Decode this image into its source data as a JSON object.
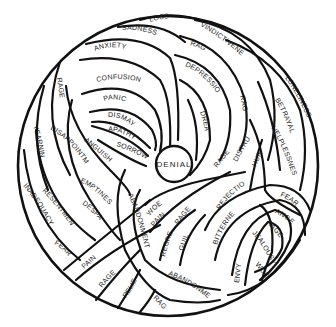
{
  "diagram": {
    "type": "tangled-emotion-ball",
    "center": "DENIAL",
    "colors": {
      "stroke": "#111111",
      "fill": "#ffffff",
      "text": "#1a1a1a"
    },
    "labels": {
      "loss": "LOSS",
      "sadness": "SADNESS",
      "anxiety": "ANXIETY",
      "confusion": "CONFUSION",
      "panic": "PANIC",
      "dismay": "DISMAY",
      "apathy": "APATHY",
      "sorrow": "SORROW",
      "rage_left": "RAGE",
      "yearning": "YEARNING",
      "disappointment": "DISAPPOINTMENT",
      "anguish": "ANGUISH",
      "emptiness": "EMPTINESS",
      "despair": "DESPAIR",
      "resentment": "RESENTMENT",
      "inadequacy": "INADEQUACY",
      "fear_left": "FEAR",
      "pain_bottom": "PAIN",
      "rage_bottom": "RAGE",
      "relief": "RELIEF",
      "rage_bottom2": "RAGE",
      "abandonment_bottom": "ABANDONMENT",
      "abandonment_mid": "ABANDONMENT",
      "woe_center": "WOE",
      "pain_center": "PAIN",
      "rage_center": "RAGE",
      "regret": "REGRET",
      "guilt": "GUILT",
      "vindictiveness": "VINDICTIVENESS",
      "rage_top": "RAGE",
      "depression": "DEPRESSION",
      "dread": "DREAD",
      "rage_right": "RAGE",
      "rage_mid": "RAGE",
      "distrust": "DISTRUST",
      "hurt": "HURT",
      "loneliness": "LONELINESS",
      "betrayal": "BETRAYAL",
      "helplessness": "HELPLESSNESS",
      "rejection": "REJECTION",
      "bitterness": "BITTERNESS",
      "fear_right": "FEAR",
      "anger": "ANGER",
      "rage_lowright": "RAGE",
      "jealousy": "JEALOUSY",
      "woe_right": "WOE",
      "envy": "ENVY"
    }
  }
}
